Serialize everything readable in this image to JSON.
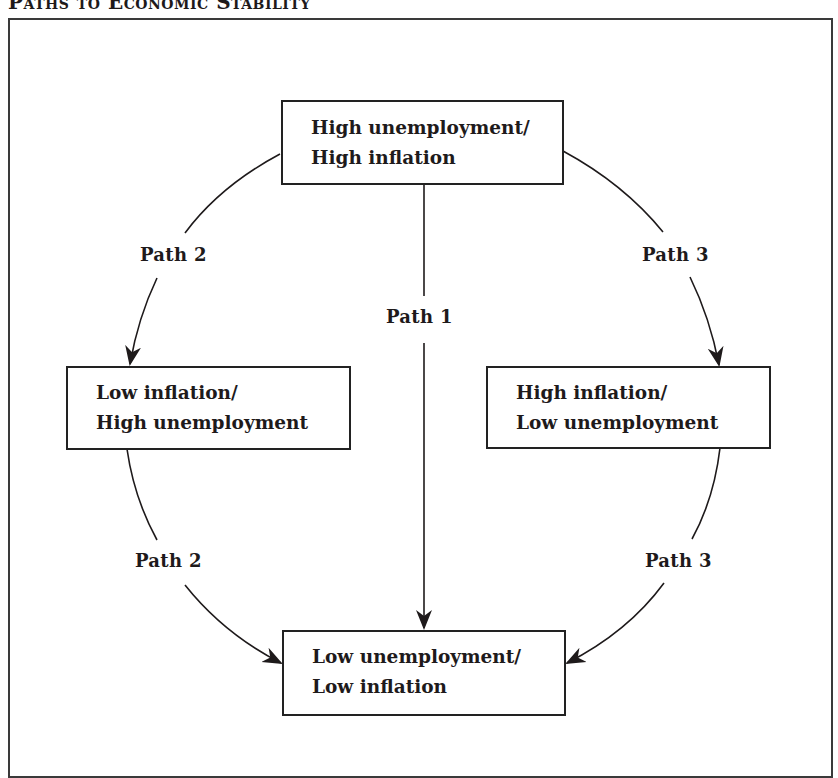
{
  "title": "Paths to Economic Stability",
  "boxes": {
    "top": {
      "line1": "High unemployment/",
      "line2": "High inflation"
    },
    "left": {
      "line1": "Low inflation/",
      "line2": "High unemployment"
    },
    "right": {
      "line1": "High inflation/",
      "line2": "Low unemployment"
    },
    "bottom": {
      "line1": "Low unemployment/",
      "line2": "Low inflation"
    }
  },
  "paths": {
    "path1": "Path 1",
    "path2_upper": "Path 2",
    "path2_lower": "Path 2",
    "path3_upper": "Path 3",
    "path3_lower": "Path 3"
  },
  "colors": {
    "line": "#1e1a1b",
    "frame": "#3a3a3a",
    "background": "#ffffff"
  }
}
